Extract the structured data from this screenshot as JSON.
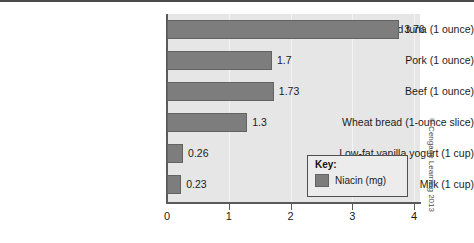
{
  "figure": {
    "credit": "© Cengage Learning 2013"
  },
  "legend": {
    "title": "Key:",
    "entries": [
      {
        "label": "Niacin (mg)",
        "color": "#7d7d7d"
      }
    ]
  },
  "chart_data": {
    "type": "bar",
    "orientation": "horizontal",
    "title": "",
    "xlabel": "",
    "ylabel": "",
    "xlim": [
      0,
      4
    ],
    "xticks": [
      0,
      1,
      2,
      3,
      4
    ],
    "xtick_labels": [
      "0",
      "1",
      "2",
      "3",
      "4"
    ],
    "grid": true,
    "legend_position": "inside-bottom-right",
    "categories": [
      "Canned tuna (1 ounce)",
      "Pork (1 ounce)",
      "Beef (1 ounce)",
      "Wheat bread (1-ounce slice)",
      "Low-fat vanilla yogurt (1 cup)",
      "Milk (1 cup)"
    ],
    "series": [
      {
        "name": "Niacin (mg)",
        "color": "#7d7d7d",
        "values": [
          3.76,
          1.7,
          1.73,
          1.3,
          0.26,
          0.23
        ],
        "value_labels": [
          "3.76",
          "1.7",
          "1.73",
          "1.3",
          "0.26",
          "0.23"
        ]
      }
    ]
  }
}
